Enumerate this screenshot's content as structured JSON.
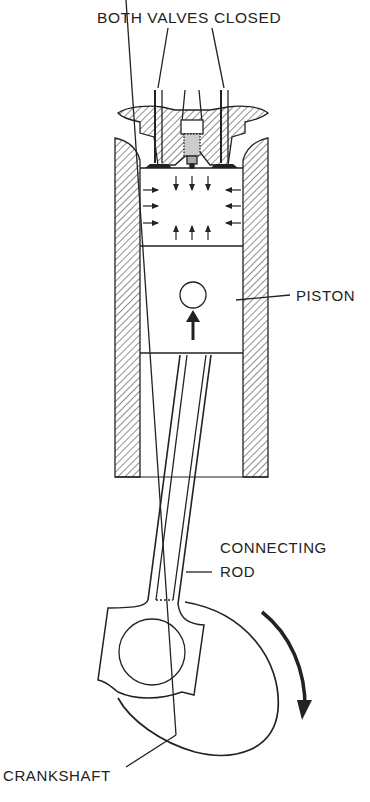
{
  "diagram": {
    "labels": {
      "valves": "BOTH VALVES CLOSED",
      "piston": "PISTON",
      "connecting_rod_line1": "CONNECTING",
      "connecting_rod_line2": "ROD",
      "crankshaft": "CRANKSHAFT"
    },
    "colors": {
      "ink": "#222222",
      "background": "#ffffff"
    },
    "components": [
      "intake valve",
      "exhaust valve",
      "spark plug",
      "cylinder wall",
      "combustion chamber",
      "piston",
      "piston pin",
      "connecting rod",
      "crankshaft"
    ],
    "arrows": {
      "chamber_pressure": "inward from all sides",
      "piston_motion": "up",
      "crank_rotation": "clockwise"
    }
  }
}
